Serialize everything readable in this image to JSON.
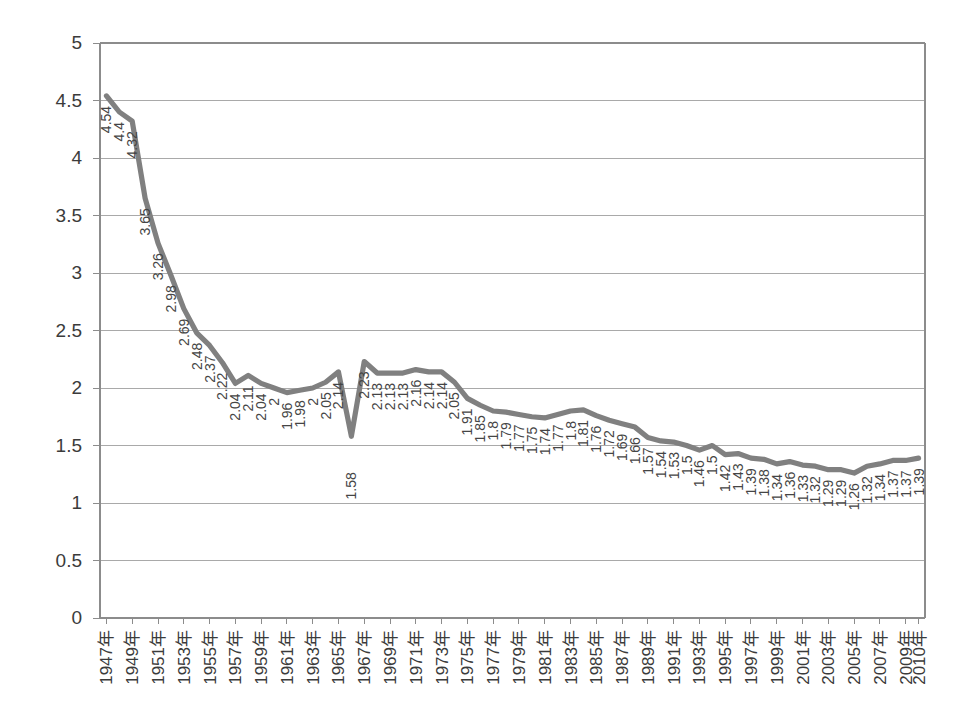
{
  "chart_data": {
    "type": "line",
    "title": "",
    "subtitle": "",
    "xlabel": "",
    "ylabel": "",
    "ylim": [
      0,
      5
    ],
    "ytick_values": [
      0,
      0.5,
      1,
      1.5,
      2,
      2.5,
      3,
      3.5,
      4,
      4.5,
      5
    ],
    "ytick_labels": [
      "0",
      "0.5",
      "1",
      "1.5",
      "2",
      "2.5",
      "3",
      "3.5",
      "4",
      "4.5",
      "5"
    ],
    "grid": true,
    "grid_axis": "y",
    "legend": false,
    "legend_position": "none",
    "line_color": "#808080",
    "year_suffix": "年",
    "x": [
      1947,
      1948,
      1949,
      1950,
      1951,
      1952,
      1953,
      1954,
      1955,
      1956,
      1957,
      1958,
      1959,
      1960,
      1961,
      1962,
      1963,
      1964,
      1965,
      1966,
      1967,
      1968,
      1969,
      1970,
      1971,
      1972,
      1973,
      1974,
      1975,
      1976,
      1977,
      1978,
      1979,
      1980,
      1981,
      1982,
      1983,
      1984,
      1985,
      1986,
      1987,
      1988,
      1989,
      1990,
      1991,
      1992,
      1993,
      1994,
      1995,
      1996,
      1997,
      1998,
      1999,
      2000,
      2001,
      2002,
      2003,
      2004,
      2005,
      2006,
      2007,
      2008,
      2009,
      2010
    ],
    "xtick_labels": [
      "1947年",
      "1949年",
      "1951年",
      "1953年",
      "1955年",
      "1957年",
      "1959年",
      "1961年",
      "1963年",
      "1965年",
      "1967年",
      "1969年",
      "1971年",
      "1973年",
      "1975年",
      "1977年",
      "1979年",
      "1981年",
      "1983年",
      "1985年",
      "1987年",
      "1989年",
      "1991年",
      "1993年",
      "1995年",
      "1997年",
      "1999年",
      "2001年",
      "2003年",
      "2005年",
      "2007年",
      "2009年",
      "2010年"
    ],
    "xtick_years": [
      1947,
      1949,
      1951,
      1953,
      1955,
      1957,
      1959,
      1961,
      1963,
      1965,
      1967,
      1969,
      1971,
      1973,
      1975,
      1977,
      1979,
      1981,
      1983,
      1985,
      1987,
      1989,
      1991,
      1993,
      1995,
      1997,
      1999,
      2001,
      2003,
      2005,
      2007,
      2009,
      2010
    ],
    "values": [
      4.54,
      4.4,
      4.32,
      3.65,
      3.26,
      2.98,
      2.69,
      2.48,
      2.37,
      2.22,
      2.04,
      2.11,
      2.04,
      2.0,
      1.96,
      1.98,
      2.0,
      2.05,
      2.14,
      1.58,
      2.23,
      2.13,
      2.13,
      2.13,
      2.16,
      2.14,
      2.14,
      2.05,
      1.91,
      1.85,
      1.8,
      1.79,
      1.77,
      1.75,
      1.74,
      1.77,
      1.8,
      1.81,
      1.76,
      1.72,
      1.69,
      1.66,
      1.57,
      1.54,
      1.53,
      1.5,
      1.46,
      1.5,
      1.42,
      1.43,
      1.39,
      1.38,
      1.34,
      1.36,
      1.33,
      1.32,
      1.29,
      1.29,
      1.26,
      1.32,
      1.34,
      1.37,
      1.37,
      1.39
    ],
    "point_labels": [
      "4.54",
      "4.4",
      "4.32",
      "3.65",
      "3.26",
      "2.98",
      "2.69",
      "2.48",
      "2.37",
      "2.22",
      "2.04",
      "2.11",
      "2.04",
      "2",
      "1.96",
      "1.98",
      "2",
      "2.05",
      "2.14",
      "1.58",
      "2.23",
      "2.13",
      "2.13",
      "2.13",
      "2.16",
      "2.14",
      "2.14",
      "2.05",
      "1.91",
      "1.85",
      "1.8",
      "1.79",
      "1.77",
      "1.75",
      "1.74",
      "1.77",
      "1.8",
      "1.81",
      "1.76",
      "1.72",
      "1.69",
      "1.66",
      "1.57",
      "1.54",
      "1.53",
      "1.5",
      "1.46",
      "1.5",
      "1.42",
      "1.43",
      "1.39",
      "1.38",
      "1.34",
      "1.36",
      "1.33",
      "1.32",
      "1.29",
      "1.29",
      "1.26",
      "1.32",
      "1.34",
      "1.37",
      "1.37",
      "1.39"
    ]
  }
}
